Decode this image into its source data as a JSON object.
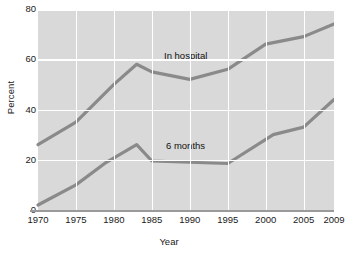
{
  "chart_data": {
    "type": "line",
    "title": "",
    "xlabel": "Year",
    "ylabel": "Percent",
    "xlim": [
      1970,
      2009
    ],
    "ylim": [
      0,
      80
    ],
    "grid": true,
    "legend_position": "inline-labels",
    "x_tick_labels": [
      "1970",
      "1975",
      "1980",
      "1985",
      "1990",
      "1995",
      "2000",
      "2005",
      "2009"
    ],
    "x_tick_values": [
      1970,
      1975,
      1980,
      1985,
      1990,
      1995,
      2000,
      2005,
      2009
    ],
    "y_tick_labels": [
      "0",
      "20",
      "40",
      "60",
      "80"
    ],
    "y_tick_values": [
      0,
      20,
      40,
      60,
      80
    ],
    "series": [
      {
        "name": "In hospital",
        "color": "#8a8a8a",
        "label_x": 1991,
        "label_y": 62,
        "x": [
          1970,
          1975,
          1980,
          1983,
          1985,
          1990,
          1995,
          2000,
          2005,
          2009
        ],
        "values": [
          26,
          35,
          50,
          58,
          55,
          52,
          56,
          66,
          69,
          74
        ]
      },
      {
        "name": "6 months",
        "color": "#8a8a8a",
        "label_x": 1991,
        "label_y": 26,
        "x": [
          1970,
          1975,
          1979,
          1983,
          1985,
          1990,
          1995,
          2001,
          2005,
          2009
        ],
        "values": [
          2,
          10,
          19,
          26,
          19.5,
          19,
          18.5,
          30,
          33,
          44
        ]
      }
    ],
    "colors": {
      "plot_background": "#d9d9d9",
      "gridline": "#ffffff",
      "line": "#8a8a8a",
      "axis": "#9a9a9a",
      "text": "#1a1a1a"
    }
  }
}
